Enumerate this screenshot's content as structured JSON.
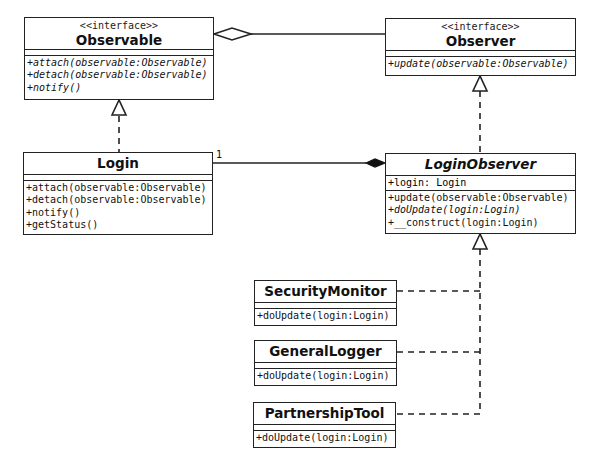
{
  "diagram": {
    "type": "UML class diagram",
    "classes": {
      "observable": {
        "stereotype": "<<interface>>",
        "name": "Observable",
        "attributes": [],
        "operations": [
          "+attach(observable:Observable)",
          "+detach(observable:Observable)",
          "+notify()"
        ]
      },
      "observer": {
        "stereotype": "<<interface>>",
        "name": "Observer",
        "attributes": [],
        "operations": [
          "+update(observable:Observable)"
        ]
      },
      "login": {
        "name": "Login",
        "attributes": [],
        "operations": [
          "+attach(observable:Observable)",
          "+detach(observable:Observable)",
          "+notify()",
          "+getStatus()"
        ]
      },
      "login_observer": {
        "name": "LoginObserver",
        "abstract": true,
        "attributes": [
          "+login: Login"
        ],
        "operations": [
          "+update(observable:Observable)",
          "+doUpdate(login:Login)",
          "+__construct(login:Login)"
        ]
      },
      "security_monitor": {
        "name": "SecurityMonitor",
        "attributes": [],
        "operations": [
          "+doUpdate(login:Login)"
        ]
      },
      "general_logger": {
        "name": "GeneralLogger",
        "attributes": [],
        "operations": [
          "+doUpdate(login:Login)"
        ]
      },
      "partnership_tool": {
        "name": "PartnershipTool",
        "attributes": [],
        "operations": [
          "+doUpdate(login:Login)"
        ]
      }
    },
    "relationships": [
      {
        "type": "aggregation",
        "from": "Observable",
        "to": "Observer"
      },
      {
        "type": "realization",
        "from": "Login",
        "to": "Observable"
      },
      {
        "type": "realization",
        "from": "LoginObserver",
        "to": "Observer"
      },
      {
        "type": "composition",
        "from": "Login",
        "to": "LoginObserver",
        "multiplicity": "1"
      },
      {
        "type": "realization",
        "from": "SecurityMonitor",
        "to": "LoginObserver"
      },
      {
        "type": "realization",
        "from": "GeneralLogger",
        "to": "LoginObserver"
      },
      {
        "type": "realization",
        "from": "PartnershipTool",
        "to": "LoginObserver"
      }
    ],
    "labels": {
      "login_composition_multiplicity": "1"
    }
  }
}
